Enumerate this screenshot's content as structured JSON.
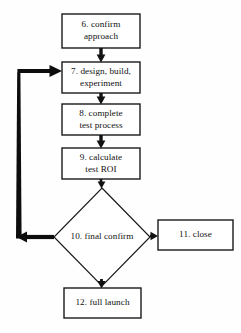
{
  "diagram": {
    "type": "flowchart",
    "background_color": "#fefefe",
    "stroke_color": "#1a1a1a",
    "fill_color": "#ffffff",
    "feedback_color": "#0d0d0d"
  },
  "nodes": {
    "step6": {
      "label": "6. confirm\napproach",
      "shape": "rectangle",
      "x": 62,
      "y": 14,
      "w": 78,
      "h": 34
    },
    "step7": {
      "label": "7. design, build,\nexperiment",
      "shape": "rectangle",
      "x": 62,
      "y": 62,
      "w": 78,
      "h": 31
    },
    "step8": {
      "label": "8. complete\ntest process",
      "shape": "rectangle",
      "x": 62,
      "y": 104,
      "w": 78,
      "h": 31
    },
    "step9": {
      "label": "9. calculate\ntest ROI",
      "shape": "rectangle",
      "x": 62,
      "y": 148,
      "w": 78,
      "h": 31
    },
    "step10": {
      "label": "10. final confirm",
      "shape": "diamond",
      "cx": 102,
      "cy": 237,
      "rx": 48,
      "ry": 49
    },
    "step11": {
      "label": "11. close",
      "shape": "rectangle",
      "x": 158,
      "y": 220,
      "w": 75,
      "h": 30
    },
    "step12": {
      "label": "12. full launch",
      "shape": "rectangle",
      "x": 64,
      "y": 288,
      "w": 77,
      "h": 30
    }
  },
  "edges": [
    {
      "name": "edge-6-to-7",
      "from": "step6",
      "to": "step7",
      "direction": "down",
      "style": "thick-arrow"
    },
    {
      "name": "edge-7-to-8",
      "from": "step7",
      "to": "step8",
      "direction": "down",
      "style": "thick-arrow"
    },
    {
      "name": "edge-8-to-9",
      "from": "step8",
      "to": "step9",
      "direction": "down",
      "style": "thick-arrow"
    },
    {
      "name": "edge-9-to-10",
      "from": "step9",
      "to": "step10",
      "direction": "down",
      "style": "thin-arrow"
    },
    {
      "name": "edge-10-to-11",
      "from": "step10",
      "to": "step11",
      "direction": "right",
      "style": "thin-arrow"
    },
    {
      "name": "edge-10-to-12",
      "from": "step10",
      "to": "step12",
      "direction": "down",
      "style": "thin-arrow"
    },
    {
      "name": "edge-10-to-7-feedback",
      "from": "step10",
      "to": "step7",
      "direction": "loop-left-up",
      "style": "thick-arrow"
    }
  ]
}
